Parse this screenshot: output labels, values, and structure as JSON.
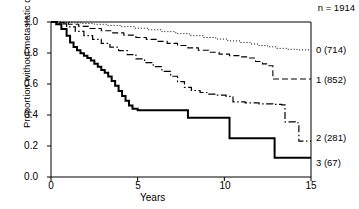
{
  "chart_data": {
    "type": "line",
    "subtype": "kaplan-meier-step",
    "title": "",
    "xlabel": "Years",
    "ylabel": "Proportion without metastatic death",
    "xlim": [
      0,
      15
    ],
    "ylim": [
      0.0,
      1.0
    ],
    "xticks": [
      "0",
      "5",
      "10",
      "15"
    ],
    "xtick_values": [
      0,
      5,
      10,
      15
    ],
    "yticks": [
      "0.0",
      "0.2",
      "0.4",
      "0.6",
      "0.8",
      "1.0"
    ],
    "ytick_values": [
      0.0,
      0.2,
      0.4,
      0.6,
      0.8,
      1.0
    ],
    "grid": false,
    "legend_position": "right-inline",
    "total_label": "n = 1914",
    "total_n": 1914,
    "series": [
      {
        "name": "0",
        "label": "0 (714)",
        "n": 714,
        "linestyle": "dotted",
        "color": "#000000",
        "points": [
          [
            0.0,
            1.0
          ],
          [
            0.6,
            0.998
          ],
          [
            1.2,
            0.995
          ],
          [
            1.8,
            0.99
          ],
          [
            2.5,
            0.985
          ],
          [
            3.2,
            0.978
          ],
          [
            4.0,
            0.97
          ],
          [
            4.8,
            0.96
          ],
          [
            5.6,
            0.95
          ],
          [
            6.4,
            0.938
          ],
          [
            7.2,
            0.925
          ],
          [
            8.0,
            0.912
          ],
          [
            8.8,
            0.9
          ],
          [
            9.5,
            0.89
          ],
          [
            10.2,
            0.878
          ],
          [
            10.9,
            0.868
          ],
          [
            11.5,
            0.858
          ],
          [
            12.0,
            0.848
          ],
          [
            12.5,
            0.84
          ],
          [
            13.0,
            0.83
          ],
          [
            13.6,
            0.824
          ],
          [
            14.2,
            0.82
          ],
          [
            15.0,
            0.82
          ]
        ]
      },
      {
        "name": "1",
        "label": "1 (852)",
        "n": 852,
        "linestyle": "dashed",
        "color": "#000000",
        "points": [
          [
            0.0,
            1.0
          ],
          [
            0.5,
            0.995
          ],
          [
            1.0,
            0.985
          ],
          [
            1.6,
            0.972
          ],
          [
            2.2,
            0.958
          ],
          [
            2.9,
            0.944
          ],
          [
            3.5,
            0.93
          ],
          [
            4.2,
            0.915
          ],
          [
            4.9,
            0.9
          ],
          [
            5.5,
            0.888
          ],
          [
            6.1,
            0.875
          ],
          [
            6.7,
            0.862
          ],
          [
            7.3,
            0.848
          ],
          [
            7.9,
            0.833
          ],
          [
            8.5,
            0.818
          ],
          [
            9.1,
            0.805
          ],
          [
            9.7,
            0.793
          ],
          [
            10.3,
            0.783
          ],
          [
            10.9,
            0.775
          ],
          [
            11.4,
            0.768
          ],
          [
            11.8,
            0.745
          ],
          [
            12.2,
            0.73
          ],
          [
            12.5,
            0.718
          ],
          [
            12.8,
            0.632
          ],
          [
            13.5,
            0.632
          ],
          [
            15.0,
            0.632
          ]
        ]
      },
      {
        "name": "2",
        "label": "2 (281)",
        "n": 281,
        "linestyle": "dashdot",
        "color": "#000000",
        "points": [
          [
            0.0,
            1.0
          ],
          [
            0.4,
            0.988
          ],
          [
            0.9,
            0.968
          ],
          [
            1.4,
            0.94
          ],
          [
            1.9,
            0.912
          ],
          [
            2.4,
            0.888
          ],
          [
            2.9,
            0.862
          ],
          [
            3.4,
            0.838
          ],
          [
            3.9,
            0.815
          ],
          [
            4.4,
            0.79
          ],
          [
            4.9,
            0.762
          ],
          [
            5.4,
            0.738
          ],
          [
            5.9,
            0.712
          ],
          [
            6.4,
            0.682
          ],
          [
            6.9,
            0.65
          ],
          [
            7.3,
            0.615
          ],
          [
            7.7,
            0.578
          ],
          [
            8.1,
            0.558
          ],
          [
            8.6,
            0.545
          ],
          [
            9.1,
            0.535
          ],
          [
            9.6,
            0.528
          ],
          [
            10.1,
            0.52
          ],
          [
            10.5,
            0.485
          ],
          [
            11.2,
            0.478
          ],
          [
            12.0,
            0.472
          ],
          [
            12.8,
            0.468
          ],
          [
            13.3,
            0.465
          ],
          [
            13.5,
            0.355
          ],
          [
            14.1,
            0.35
          ],
          [
            14.3,
            0.232
          ],
          [
            15.0,
            0.232
          ]
        ]
      },
      {
        "name": "3",
        "label": "3 (67)",
        "n": 67,
        "linestyle": "solid",
        "color": "#000000",
        "points": [
          [
            0.0,
            1.0
          ],
          [
            0.3,
            0.985
          ],
          [
            0.6,
            0.955
          ],
          [
            0.9,
            0.912
          ],
          [
            1.1,
            0.868
          ],
          [
            1.3,
            0.838
          ],
          [
            1.5,
            0.818
          ],
          [
            1.7,
            0.798
          ],
          [
            1.9,
            0.782
          ],
          [
            2.1,
            0.768
          ],
          [
            2.3,
            0.752
          ],
          [
            2.5,
            0.73
          ],
          [
            2.7,
            0.712
          ],
          [
            2.9,
            0.69
          ],
          [
            3.1,
            0.672
          ],
          [
            3.3,
            0.648
          ],
          [
            3.5,
            0.62
          ],
          [
            3.7,
            0.588
          ],
          [
            3.9,
            0.555
          ],
          [
            4.1,
            0.522
          ],
          [
            4.3,
            0.492
          ],
          [
            4.5,
            0.462
          ],
          [
            4.7,
            0.44
          ],
          [
            5.0,
            0.43
          ],
          [
            6.0,
            0.43
          ],
          [
            7.0,
            0.43
          ],
          [
            7.7,
            0.43
          ],
          [
            7.9,
            0.382
          ],
          [
            9.0,
            0.382
          ],
          [
            10.1,
            0.382
          ],
          [
            10.3,
            0.25
          ],
          [
            11.5,
            0.25
          ],
          [
            12.7,
            0.25
          ],
          [
            12.9,
            0.125
          ],
          [
            14.0,
            0.125
          ],
          [
            15.0,
            0.125
          ]
        ]
      }
    ]
  },
  "labels": {
    "n_total": "n = 1914",
    "y_axis_title": "Proportion without metastatic death",
    "x_axis_title": "Years",
    "series_0": "0 (714)",
    "series_1": "1 (852)",
    "series_2": "2 (281)",
    "series_3": "3 (67)",
    "ytick_0": "0.0",
    "ytick_1": "0.2",
    "ytick_2": "0.4",
    "ytick_3": "0.6",
    "ytick_4": "0.8",
    "ytick_5": "1.0",
    "xtick_0": "0",
    "xtick_1": "5",
    "xtick_2": "10",
    "xtick_3": "15"
  }
}
